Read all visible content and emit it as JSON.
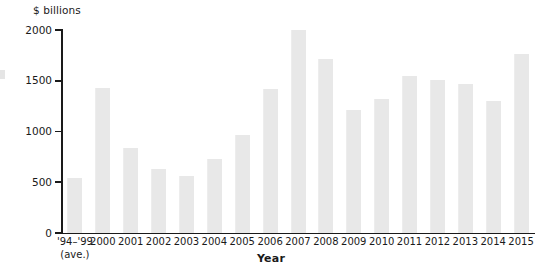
{
  "chart_data": {
    "type": "bar",
    "title": "",
    "subtitle": "",
    "xlabel": "Year",
    "ylabel": "$ billions",
    "ylim": [
      0,
      2000
    ],
    "yticks": [
      0,
      500,
      1000,
      1500,
      2000
    ],
    "ytick_labels": [
      "0",
      "500",
      "1000",
      "1500",
      "2000"
    ],
    "grid": false,
    "legend": null,
    "bar_color": "#e8e8e8",
    "axis_color": "#1a1a1a",
    "background_color": "#ffffff",
    "categories": [
      "'94–'99",
      "2000",
      "2001",
      "2002",
      "2003",
      "2004",
      "2005",
      "2006",
      "2007",
      "2008",
      "2009",
      "2010",
      "2011",
      "2012",
      "2013",
      "2014",
      "2015"
    ],
    "category_sublabels": [
      "(ave.)",
      "",
      "",
      "",
      "",
      "",
      "",
      "",
      "",
      "",
      "",
      "",
      "",
      "",
      "",
      "",
      ""
    ],
    "values": [
      545,
      1430,
      835,
      630,
      560,
      725,
      965,
      1420,
      2000,
      1710,
      1210,
      1325,
      1545,
      1510,
      1470,
      1300,
      1760
    ]
  },
  "axis": {
    "y_unit_caption": "$ billions",
    "x_axis_title": "Year"
  }
}
